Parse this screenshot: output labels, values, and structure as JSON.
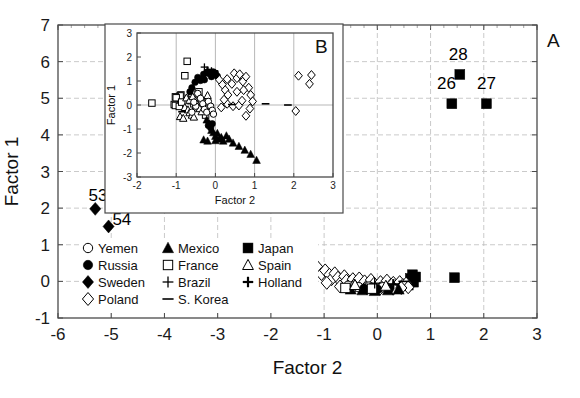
{
  "figure": {
    "panel_a_letter": "A",
    "panel_b_letter": "B"
  },
  "chart_data": [
    {
      "id": "panel-a",
      "type": "scatter",
      "title": "",
      "xlabel": "Factor 2",
      "ylabel": "Factor 1",
      "xlim": [
        -6,
        3
      ],
      "ylim": [
        -1,
        7
      ],
      "xticks": [
        -6,
        -5,
        -4,
        -3,
        -2,
        -1,
        0,
        1,
        2,
        3
      ],
      "xticklabels": [
        "-6",
        "-5",
        "-4",
        "-3",
        "-2",
        "-1",
        "0",
        "1",
        "2",
        "3"
      ],
      "yticks": [
        -1,
        0,
        1,
        2,
        3,
        4,
        5,
        6,
        7
      ],
      "yticklabels": [
        "-1",
        "0",
        "1",
        "2",
        "3",
        "4",
        "5",
        "6",
        "7"
      ],
      "grid": true,
      "legend_position": "lower-left-inside",
      "annotations": [
        {
          "text": "53",
          "x": -5.25,
          "y": 2.2
        },
        {
          "text": "54",
          "x": -4.8,
          "y": 1.55
        },
        {
          "text": "28",
          "x": 1.52,
          "y": 6.05
        },
        {
          "text": "26",
          "x": 1.3,
          "y": 5.25
        },
        {
          "text": "27",
          "x": 2.05,
          "y": 5.25
        }
      ],
      "series": [
        {
          "name": "Sweden",
          "marker": "diamond-filled",
          "points": [
            [
              -5.3,
              1.98
            ],
            [
              -5.05,
              1.5
            ]
          ]
        },
        {
          "name": "Japan",
          "marker": "square-filled",
          "points": [
            [
              1.55,
              5.65
            ],
            [
              1.4,
              4.85
            ],
            [
              2.05,
              4.85
            ],
            [
              0.62,
              0.08
            ],
            [
              0.68,
              -0.02
            ],
            [
              0.72,
              0.12
            ],
            [
              0.58,
              -0.1
            ],
            [
              0.66,
              0.18
            ],
            [
              1.45,
              0.1
            ]
          ]
        },
        {
          "name": "Poland",
          "marker": "diamond-open",
          "points": [
            [
              -1.22,
              0.28
            ],
            [
              -1.12,
              0.38
            ],
            [
              -1.05,
              0.2
            ],
            [
              -1.3,
              0.08
            ],
            [
              -0.98,
              0.3
            ],
            [
              -0.9,
              0.18
            ],
            [
              -0.86,
              0.06
            ],
            [
              -0.8,
              0.22
            ],
            [
              -0.74,
              0.1
            ],
            [
              -0.68,
              -0.02
            ],
            [
              -0.62,
              0.14
            ],
            [
              -0.58,
              0.02
            ],
            [
              -0.52,
              -0.08
            ],
            [
              -0.46,
              0.06
            ],
            [
              -0.4,
              -0.04
            ],
            [
              -0.34,
              0.08
            ],
            [
              -0.3,
              -0.12
            ],
            [
              -0.24,
              0.0
            ],
            [
              -0.18,
              -0.1
            ],
            [
              -0.12,
              0.04
            ],
            [
              -0.06,
              -0.06
            ],
            [
              0.0,
              -0.14
            ],
            [
              0.06,
              -0.02
            ],
            [
              0.12,
              -0.1
            ],
            [
              0.18,
              0.02
            ],
            [
              0.24,
              -0.12
            ],
            [
              0.3,
              -0.04
            ],
            [
              0.36,
              -0.14
            ],
            [
              0.42,
              -0.02
            ],
            [
              0.48,
              -0.1
            ],
            [
              0.54,
              -0.06
            ],
            [
              0.58,
              -0.16
            ],
            [
              -0.95,
              -0.04
            ],
            [
              -0.7,
              -0.14
            ],
            [
              -0.45,
              -0.16
            ],
            [
              -0.2,
              -0.18
            ],
            [
              0.05,
              -0.2
            ],
            [
              0.3,
              -0.2
            ],
            [
              0.45,
              -0.18
            ]
          ]
        },
        {
          "name": "Yemen",
          "marker": "circle-open",
          "points": [
            [
              -0.55,
              -0.12
            ],
            [
              -0.35,
              -0.16
            ],
            [
              -0.15,
              -0.14
            ],
            [
              0.1,
              -0.16
            ]
          ]
        },
        {
          "name": "Russia",
          "marker": "circle-filled",
          "points": [
            [
              -0.25,
              -0.2
            ],
            [
              0.0,
              -0.22
            ],
            [
              0.22,
              -0.2
            ]
          ]
        },
        {
          "name": "Mexico",
          "marker": "triangle-filled",
          "points": [
            [
              -0.5,
              -0.22
            ],
            [
              -0.28,
              -0.24
            ],
            [
              -0.05,
              -0.26
            ],
            [
              0.2,
              -0.24
            ],
            [
              0.4,
              -0.22
            ]
          ]
        },
        {
          "name": "France",
          "marker": "square-open",
          "points": [
            [
              -0.6,
              -0.18
            ],
            [
              -0.1,
              -0.2
            ]
          ]
        },
        {
          "name": "Spain",
          "marker": "triangle-open",
          "points": [
            [
              -0.42,
              -0.1
            ],
            [
              0.16,
              -0.12
            ]
          ]
        },
        {
          "name": "Brazil",
          "marker": "plus",
          "points": [
            [
              -0.05,
              -0.05
            ]
          ]
        },
        {
          "name": "Holland",
          "marker": "plus-bold",
          "points": [
            [
              0.3,
              -0.08
            ]
          ]
        },
        {
          "name": "S. Korea",
          "marker": "dash",
          "points": [
            [
              0.5,
              0.0
            ]
          ]
        }
      ]
    },
    {
      "id": "panel-b",
      "type": "scatter",
      "title": "",
      "xlabel": "Factor 2",
      "ylabel": "Factor 1",
      "xlim": [
        -2,
        3
      ],
      "ylim": [
        -3,
        3
      ],
      "xticks": [
        -2,
        -1,
        0,
        1,
        2,
        3
      ],
      "xticklabels": [
        "-2",
        "-1",
        "0",
        "1",
        "2",
        "3"
      ],
      "yticks": [
        -3,
        -2,
        -1,
        0,
        1,
        2,
        3
      ],
      "yticklabels": [
        "-3",
        "-2",
        "-1",
        "0",
        "1",
        "2",
        "3"
      ],
      "grid": true,
      "legend_position": "none",
      "series": [
        {
          "name": "France",
          "marker": "square-open",
          "points": [
            [
              -0.72,
              1.82
            ],
            [
              -0.78,
              1.22
            ],
            [
              -0.88,
              0.42
            ],
            [
              -0.9,
              0.38
            ],
            [
              -1.02,
              0.34
            ],
            [
              -1.0,
              0.3
            ],
            [
              -1.05,
              0.02
            ],
            [
              -1.02,
              -0.02
            ],
            [
              -0.92,
              -0.06
            ],
            [
              -0.86,
              0.12
            ],
            [
              -1.62,
              0.08
            ],
            [
              -0.6,
              0.45
            ],
            [
              -0.62,
              0.18
            ],
            [
              -0.55,
              0.05
            ],
            [
              -0.5,
              -0.12
            ],
            [
              -0.42,
              0.55
            ],
            [
              -0.3,
              -0.25
            ],
            [
              -0.25,
              -0.42
            ]
          ]
        },
        {
          "name": "Spain",
          "marker": "triangle-open",
          "points": [
            [
              -0.78,
              -0.1
            ],
            [
              -0.7,
              -0.2
            ],
            [
              -0.66,
              -0.32
            ],
            [
              -0.6,
              -0.42
            ],
            [
              -0.55,
              -0.5
            ],
            [
              -0.9,
              -0.48
            ],
            [
              -0.82,
              -0.55
            ],
            [
              -0.74,
              0.3
            ],
            [
              -0.66,
              0.2
            ],
            [
              -0.58,
              0.35
            ],
            [
              -0.5,
              0.18
            ],
            [
              -0.46,
              0.02
            ],
            [
              -0.4,
              -0.15
            ],
            [
              -0.35,
              -0.28
            ],
            [
              -0.3,
              0.12
            ],
            [
              -0.2,
              0.4
            ]
          ]
        },
        {
          "name": "Yemen",
          "marker": "circle-open",
          "points": [
            [
              -0.45,
              0.48
            ],
            [
              -0.38,
              0.28
            ],
            [
              -0.32,
              0.05
            ],
            [
              -0.28,
              -0.18
            ],
            [
              -0.22,
              -0.3
            ],
            [
              -0.18,
              0.15
            ],
            [
              -0.12,
              -0.05
            ],
            [
              -0.08,
              -0.22
            ],
            [
              -0.05,
              -0.38
            ],
            [
              -0.5,
              -0.05
            ],
            [
              -0.55,
              0.12
            ],
            [
              -0.6,
              -0.3
            ]
          ]
        },
        {
          "name": "Russia",
          "marker": "circle-filled",
          "points": [
            [
              -0.52,
              0.95
            ],
            [
              -0.45,
              1.15
            ],
            [
              -0.38,
              1.02
            ],
            [
              -0.3,
              1.28
            ],
            [
              -0.22,
              1.35
            ],
            [
              -0.15,
              1.3
            ],
            [
              -0.1,
              1.18
            ],
            [
              -0.05,
              1.38
            ],
            [
              0.0,
              1.32
            ],
            [
              0.05,
              1.2
            ],
            [
              -0.28,
              1.05
            ],
            [
              -0.6,
              0.72
            ],
            [
              -0.65,
              0.55
            ],
            [
              -0.18,
              -0.85
            ],
            [
              -0.12,
              -0.95
            ],
            [
              -0.08,
              -0.78
            ]
          ]
        },
        {
          "name": "Mexico",
          "marker": "triangle-filled",
          "points": [
            [
              -0.22,
              -0.62
            ],
            [
              -0.15,
              -0.78
            ],
            [
              -0.1,
              -1.05
            ],
            [
              -0.05,
              -1.15
            ],
            [
              0.0,
              -1.3
            ],
            [
              0.05,
              -1.18
            ],
            [
              0.1,
              -1.42
            ],
            [
              0.15,
              -1.35
            ],
            [
              0.2,
              -1.5
            ],
            [
              0.28,
              -1.28
            ],
            [
              0.35,
              -1.42
            ],
            [
              0.45,
              -1.58
            ],
            [
              0.6,
              -1.72
            ],
            [
              0.75,
              -1.88
            ],
            [
              0.9,
              -2.05
            ],
            [
              1.05,
              -2.3
            ],
            [
              -0.3,
              -1.45
            ],
            [
              -0.2,
              -1.5
            ],
            [
              0.0,
              -1.48
            ]
          ]
        },
        {
          "name": "Poland",
          "marker": "diamond-open",
          "points": [
            [
              0.1,
              1.05
            ],
            [
              0.18,
              0.85
            ],
            [
              0.25,
              0.62
            ],
            [
              0.32,
              0.42
            ],
            [
              0.3,
              1.08
            ],
            [
              0.42,
              0.88
            ],
            [
              0.48,
              1.32
            ],
            [
              0.55,
              1.12
            ],
            [
              0.62,
              1.28
            ],
            [
              0.7,
              0.98
            ],
            [
              0.78,
              1.18
            ],
            [
              0.85,
              0.72
            ],
            [
              0.9,
              0.42
            ],
            [
              0.95,
              0.15
            ],
            [
              0.88,
              -0.15
            ],
            [
              0.78,
              -0.45
            ],
            [
              0.3,
              0.05
            ],
            [
              0.45,
              -0.05
            ],
            [
              0.6,
              -0.02
            ],
            [
              0.68,
              0.18
            ],
            [
              0.22,
              0.22
            ],
            [
              0.15,
              -0.1
            ],
            [
              2.12,
              1.22
            ],
            [
              2.45,
              1.25
            ],
            [
              2.4,
              0.88
            ],
            [
              2.05,
              -0.25
            ],
            [
              0.55,
              0.55
            ],
            [
              0.72,
              0.62
            ]
          ]
        },
        {
          "name": "Brazil",
          "marker": "plus",
          "points": [
            [
              -0.28,
              1.58
            ],
            [
              -0.48,
              0.98
            ],
            [
              -0.1,
              1.42
            ],
            [
              -0.35,
              1.2
            ]
          ]
        },
        {
          "name": "S. Korea",
          "marker": "dash",
          "points": [
            [
              0.42,
              0.02
            ],
            [
              1.28,
              0.05
            ],
            [
              -0.85,
              -0.28
            ],
            [
              1.85,
              0.0
            ]
          ]
        },
        {
          "name": "Holland",
          "marker": "plus-bold",
          "points": [
            [
              -0.2,
              1.45
            ],
            [
              -0.05,
              1.3
            ]
          ]
        },
        {
          "name": "Japan",
          "marker": "square-filled",
          "points": [
            [
              -0.15,
              1.36
            ],
            [
              -0.02,
              1.3
            ]
          ]
        }
      ]
    }
  ],
  "legend": {
    "columns": [
      {
        "items": [
          {
            "label": "Yemen",
            "marker": "circle-open"
          },
          {
            "label": "Russia",
            "marker": "circle-filled"
          },
          {
            "label": "Sweden",
            "marker": "diamond-filled"
          },
          {
            "label": "Poland",
            "marker": "diamond-open"
          }
        ]
      },
      {
        "items": [
          {
            "label": "Mexico",
            "marker": "triangle-filled"
          },
          {
            "label": "France",
            "marker": "square-open"
          },
          {
            "label": "Brazil",
            "marker": "plus"
          },
          {
            "label": "S. Korea",
            "marker": "dash"
          }
        ]
      },
      {
        "items": [
          {
            "label": "Japan",
            "marker": "square-filled"
          },
          {
            "label": "Spain",
            "marker": "triangle-open"
          },
          {
            "label": "Holland",
            "marker": "plus-bold"
          }
        ]
      }
    ]
  }
}
